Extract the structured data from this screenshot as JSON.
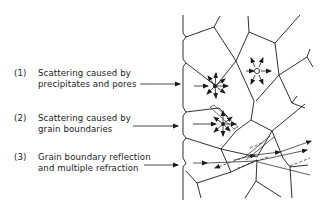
{
  "figure": {
    "labels": [
      {
        "num": "(1)",
        "line1": "Scattering caused by",
        "line2": "precipitates and pores"
      },
      {
        "num": "(2)",
        "line1": "Scattering caused by",
        "line2": "grain boundaries"
      },
      {
        "num": "(3)",
        "line1": "Grain boundary reflection",
        "line2": "and multiple refraction"
      }
    ],
    "colors": {
      "line": "#1a1a1a",
      "background": "#ffffff"
    }
  }
}
